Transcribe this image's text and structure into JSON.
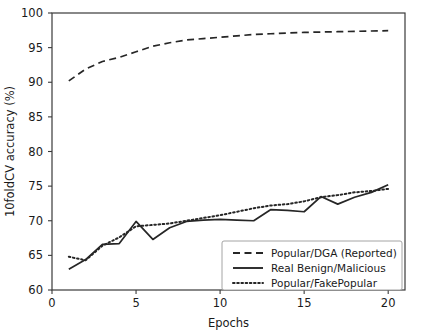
{
  "chart_data": {
    "type": "line",
    "title": "",
    "xlabel": "Epochs",
    "ylabel": "10foldCV accuracy (%)",
    "xlim": [
      0,
      21
    ],
    "ylim": [
      60,
      100
    ],
    "xticks": [
      0,
      5,
      10,
      15,
      20
    ],
    "xtick_labels": [
      "0",
      "5",
      "10",
      "15",
      "20"
    ],
    "yticks": [
      60,
      65,
      70,
      75,
      80,
      85,
      90,
      95,
      100
    ],
    "ytick_labels": [
      "60",
      "65",
      "70",
      "75",
      "80",
      "85",
      "90",
      "95",
      "100"
    ],
    "grid": false,
    "legend_position": "lower right",
    "x": [
      1,
      2,
      3,
      4,
      5,
      6,
      7,
      8,
      9,
      10,
      11,
      12,
      13,
      14,
      15,
      16,
      17,
      18,
      19,
      20
    ],
    "series": [
      {
        "name": "Popular/DGA (Reported)",
        "style": "dashed",
        "color": "#262626",
        "values": [
          90.2,
          91.9,
          93.0,
          93.6,
          94.4,
          95.2,
          95.7,
          96.1,
          96.3,
          96.5,
          96.7,
          96.9,
          97.0,
          97.1,
          97.2,
          97.25,
          97.3,
          97.35,
          97.4,
          97.45
        ]
      },
      {
        "name": "Real Benign/Malicious",
        "style": "solid",
        "color": "#262626",
        "values": [
          63.0,
          64.4,
          66.6,
          66.7,
          69.9,
          67.3,
          69.0,
          69.9,
          70.1,
          70.2,
          70.1,
          70.0,
          71.6,
          71.5,
          71.3,
          73.5,
          72.4,
          73.4,
          74.1,
          75.2
        ]
      },
      {
        "name": "Popular/FakePopular",
        "style": "dotted",
        "color": "#262626",
        "values": [
          64.8,
          64.3,
          66.4,
          67.6,
          69.2,
          69.4,
          69.6,
          70.0,
          70.4,
          70.8,
          71.3,
          71.8,
          72.2,
          72.4,
          72.8,
          73.4,
          73.7,
          74.1,
          74.3,
          74.6
        ]
      }
    ]
  },
  "legend": {
    "entries": [
      {
        "label": "Popular/DGA (Reported)",
        "style": "dashed"
      },
      {
        "label": "Real Benign/Malicious",
        "style": "solid"
      },
      {
        "label": "Popular/FakePopular",
        "style": "dotted"
      }
    ]
  }
}
